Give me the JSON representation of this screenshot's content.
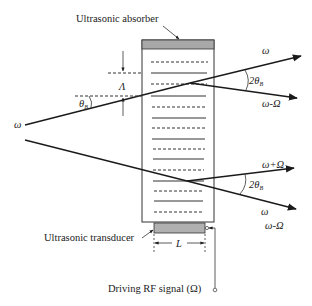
{
  "labels": {
    "absorber": "Ultrasonic absorber",
    "transducer": "Ultrasonic transducer",
    "rf_signal": "Driving RF signal (Ω)",
    "lambda": "Λ",
    "theta_b": "θ",
    "theta_sub": "B",
    "two_theta_upper": "2θ",
    "two_theta_upper_sub": "B",
    "two_theta_lower": "2θ",
    "two_theta_lower_sub": "B",
    "length": "L",
    "omega_in_upper": "ω",
    "omega_out_upper": "ω",
    "omega_minus_upper": "ω-Ω",
    "omega_plus_lower": "ω+Ω",
    "omega_out_lower": "ω",
    "omega_minus_lower": "ω-Ω"
  },
  "colors": {
    "absorber_fill": "#a8a8a8",
    "transducer_fill": "#b0b0b0",
    "line": "#1a1a1a"
  }
}
